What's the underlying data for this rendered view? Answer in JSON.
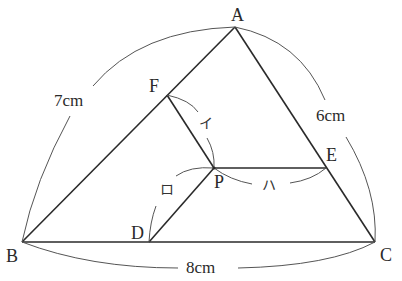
{
  "diagram": {
    "type": "geometry-triangle",
    "points": {
      "A": {
        "label": "A",
        "x": 235,
        "y": 27
      },
      "B": {
        "label": "B",
        "x": 22,
        "y": 242
      },
      "C": {
        "label": "C",
        "x": 375,
        "y": 242
      },
      "D": {
        "label": "D",
        "x": 149,
        "y": 242
      },
      "E": {
        "label": "E",
        "x": 326,
        "y": 168
      },
      "F": {
        "label": "F",
        "x": 167,
        "y": 95
      },
      "P": {
        "label": "P",
        "x": 214,
        "y": 168
      }
    },
    "side_lengths": {
      "AB": "7cm",
      "AC": "6cm",
      "BC": "8cm"
    },
    "segment_marks": {
      "PF": "イ",
      "PD": "ロ",
      "PE": "ハ"
    },
    "colors": {
      "line": "#2a2a2a",
      "arc": "#555555",
      "background": "#ffffff"
    }
  }
}
